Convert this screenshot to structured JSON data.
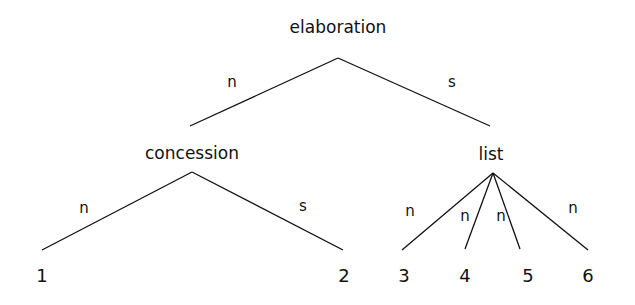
{
  "diagram": {
    "type": "RST discourse tree",
    "nodes": {
      "root": {
        "label": "elaboration",
        "x": 338,
        "y": 27,
        "apex": [
          338,
          58
        ]
      },
      "concession": {
        "label": "concession",
        "x": 192,
        "y": 153,
        "apex": [
          192,
          172
        ]
      },
      "list": {
        "label": "list",
        "x": 491,
        "y": 154,
        "apex": [
          493,
          173
        ]
      }
    },
    "leaves": [
      {
        "label": "1",
        "x": 42,
        "y": 276
      },
      {
        "label": "2",
        "x": 344,
        "y": 276
      },
      {
        "label": "3",
        "x": 404,
        "y": 276
      },
      {
        "label": "4",
        "x": 465,
        "y": 276
      },
      {
        "label": "5",
        "x": 528,
        "y": 276
      },
      {
        "label": "6",
        "x": 588,
        "y": 276
      }
    ],
    "edges": [
      {
        "from": [
          338,
          58
        ],
        "to": [
          190,
          126
        ],
        "label": "n",
        "lx": 232,
        "ly": 82
      },
      {
        "from": [
          338,
          58
        ],
        "to": [
          490,
          126
        ],
        "label": "s",
        "lx": 452,
        "ly": 82
      },
      {
        "from": [
          192,
          172
        ],
        "to": [
          42,
          250
        ],
        "label": "n",
        "lx": 84,
        "ly": 208
      },
      {
        "from": [
          192,
          172
        ],
        "to": [
          343,
          250
        ],
        "label": "s",
        "lx": 303,
        "ly": 206
      },
      {
        "from": [
          493,
          173
        ],
        "to": [
          402,
          250
        ],
        "label": "n",
        "lx": 410,
        "ly": 211
      },
      {
        "from": [
          493,
          173
        ],
        "to": [
          465,
          249
        ],
        "label": "n",
        "lx": 465,
        "ly": 216
      },
      {
        "from": [
          493,
          173
        ],
        "to": [
          520,
          249
        ],
        "label": "n",
        "lx": 501,
        "ly": 216
      },
      {
        "from": [
          493,
          173
        ],
        "to": [
          588,
          250
        ],
        "label": "n",
        "lx": 573,
        "ly": 208
      }
    ]
  }
}
